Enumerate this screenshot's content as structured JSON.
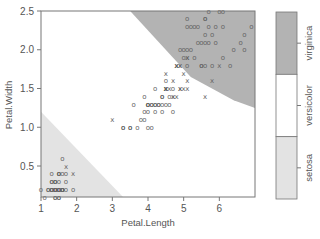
{
  "chart_data": {
    "type": "scatter",
    "title": "",
    "xlabel": "Petal.Length",
    "ylabel": "Petal.Width",
    "xlim": [
      1.0,
      7.0
    ],
    "ylim": [
      0.1,
      2.5
    ],
    "x_ticks": [
      "1",
      "2",
      "3",
      "4",
      "5",
      "6"
    ],
    "y_ticks": [
      "0.5",
      "1.0",
      "1.5",
      "2.0",
      "2.5"
    ],
    "grid": false,
    "legend": {
      "position": "right",
      "type": "colorbar",
      "entries": [
        {
          "label": "virginica",
          "color": "#b3b3b3"
        },
        {
          "label": "versicolor",
          "color": "#ffffff"
        },
        {
          "label": "setosa",
          "color": "#e3e3e3"
        }
      ]
    },
    "regions": [
      {
        "class": "setosa",
        "color": "#e3e3e3",
        "polygon": [
          [
            1.0,
            1.2
          ],
          [
            1.0,
            0.1
          ],
          [
            3.3,
            0.1
          ]
        ]
      },
      {
        "class": "virginica",
        "color": "#b3b3b3",
        "polygon": [
          [
            3.5,
            2.5
          ],
          [
            7.0,
            2.5
          ],
          [
            7.0,
            1.25
          ],
          [
            6.4,
            1.35
          ],
          [
            5.2,
            1.65
          ],
          [
            4.6,
            1.95
          ],
          [
            3.5,
            2.5
          ]
        ]
      }
    ],
    "markers": {
      "support_vector": "x",
      "data_point": "o"
    },
    "series": [
      {
        "name": "setosa",
        "points": [
          [
            1.4,
            0.2
          ],
          [
            1.4,
            0.2
          ],
          [
            1.3,
            0.2
          ],
          [
            1.5,
            0.2
          ],
          [
            1.4,
            0.2
          ],
          [
            1.7,
            0.4
          ],
          [
            1.4,
            0.3
          ],
          [
            1.5,
            0.2
          ],
          [
            1.4,
            0.2
          ],
          [
            1.5,
            0.1
          ],
          [
            1.5,
            0.2
          ],
          [
            1.6,
            0.2
          ],
          [
            1.4,
            0.1
          ],
          [
            1.1,
            0.1
          ],
          [
            1.2,
            0.2
          ],
          [
            1.5,
            0.4
          ],
          [
            1.3,
            0.4
          ],
          [
            1.4,
            0.3
          ],
          [
            1.7,
            0.3
          ],
          [
            1.5,
            0.3
          ],
          [
            1.7,
            0.2
          ],
          [
            1.5,
            0.4
          ],
          [
            1.0,
            0.2
          ],
          [
            1.7,
            0.5
          ],
          [
            1.9,
            0.2
          ],
          [
            1.6,
            0.2
          ],
          [
            1.6,
            0.4
          ],
          [
            1.5,
            0.2
          ],
          [
            1.4,
            0.2
          ],
          [
            1.6,
            0.2
          ],
          [
            1.6,
            0.2
          ],
          [
            1.5,
            0.4
          ],
          [
            1.5,
            0.1
          ],
          [
            1.4,
            0.2
          ],
          [
            1.5,
            0.2
          ],
          [
            1.2,
            0.2
          ],
          [
            1.3,
            0.2
          ],
          [
            1.4,
            0.1
          ],
          [
            1.3,
            0.2
          ],
          [
            1.5,
            0.2
          ],
          [
            1.3,
            0.3
          ],
          [
            1.3,
            0.3
          ],
          [
            1.3,
            0.2
          ],
          [
            1.6,
            0.6
          ],
          [
            1.9,
            0.4
          ],
          [
            1.4,
            0.3
          ],
          [
            1.6,
            0.2
          ],
          [
            1.4,
            0.2
          ],
          [
            1.5,
            0.2
          ],
          [
            1.4,
            0.2
          ]
        ]
      },
      {
        "name": "versicolor",
        "points": [
          [
            4.7,
            1.4
          ],
          [
            4.5,
            1.5
          ],
          [
            4.9,
            1.5
          ],
          [
            4.0,
            1.3
          ],
          [
            4.6,
            1.5
          ],
          [
            4.5,
            1.3
          ],
          [
            4.7,
            1.6
          ],
          [
            3.3,
            1.0
          ],
          [
            4.6,
            1.3
          ],
          [
            3.9,
            1.4
          ],
          [
            3.5,
            1.0
          ],
          [
            4.2,
            1.5
          ],
          [
            4.0,
            1.0
          ],
          [
            4.7,
            1.4
          ],
          [
            3.6,
            1.3
          ],
          [
            4.4,
            1.4
          ],
          [
            4.5,
            1.5
          ],
          [
            4.1,
            1.0
          ],
          [
            4.5,
            1.5
          ],
          [
            3.9,
            1.1
          ],
          [
            4.8,
            1.8
          ],
          [
            4.0,
            1.3
          ],
          [
            4.9,
            1.5
          ],
          [
            4.7,
            1.2
          ],
          [
            4.3,
            1.3
          ],
          [
            4.4,
            1.4
          ],
          [
            4.8,
            1.4
          ],
          [
            5.0,
            1.7
          ],
          [
            4.5,
            1.5
          ],
          [
            3.5,
            1.0
          ],
          [
            3.8,
            1.1
          ],
          [
            3.7,
            1.0
          ],
          [
            3.9,
            1.2
          ],
          [
            5.1,
            1.6
          ],
          [
            4.5,
            1.5
          ],
          [
            4.5,
            1.6
          ],
          [
            4.7,
            1.5
          ],
          [
            4.4,
            1.3
          ],
          [
            4.1,
            1.3
          ],
          [
            4.0,
            1.3
          ],
          [
            4.4,
            1.2
          ],
          [
            4.6,
            1.4
          ],
          [
            4.0,
            1.2
          ],
          [
            3.3,
            1.0
          ],
          [
            4.2,
            1.3
          ],
          [
            4.2,
            1.2
          ],
          [
            4.2,
            1.3
          ],
          [
            4.3,
            1.3
          ],
          [
            3.0,
            1.1
          ],
          [
            4.1,
            1.3
          ]
        ]
      },
      {
        "name": "virginica",
        "points": [
          [
            6.0,
            2.5
          ],
          [
            5.1,
            1.9
          ],
          [
            5.9,
            2.1
          ],
          [
            5.6,
            1.8
          ],
          [
            5.8,
            2.2
          ],
          [
            6.6,
            2.1
          ],
          [
            4.5,
            1.7
          ],
          [
            6.3,
            1.8
          ],
          [
            5.8,
            1.8
          ],
          [
            6.1,
            2.5
          ],
          [
            5.1,
            2.0
          ],
          [
            5.3,
            1.9
          ],
          [
            5.5,
            2.1
          ],
          [
            5.0,
            2.0
          ],
          [
            5.1,
            2.4
          ],
          [
            5.3,
            2.3
          ],
          [
            5.5,
            1.8
          ],
          [
            6.7,
            2.2
          ],
          [
            6.9,
            2.3
          ],
          [
            5.0,
            1.5
          ],
          [
            5.7,
            2.3
          ],
          [
            4.9,
            2.0
          ],
          [
            6.7,
            2.0
          ],
          [
            4.9,
            1.8
          ],
          [
            5.7,
            2.1
          ],
          [
            6.0,
            1.8
          ],
          [
            4.8,
            1.8
          ],
          [
            4.9,
            1.8
          ],
          [
            5.6,
            2.1
          ],
          [
            5.8,
            1.6
          ],
          [
            6.1,
            1.9
          ],
          [
            6.4,
            2.0
          ],
          [
            5.6,
            2.2
          ],
          [
            5.1,
            1.5
          ],
          [
            5.6,
            1.4
          ],
          [
            6.1,
            2.3
          ],
          [
            5.6,
            2.4
          ],
          [
            5.5,
            1.8
          ],
          [
            4.8,
            1.8
          ],
          [
            5.4,
            2.1
          ],
          [
            5.6,
            2.4
          ],
          [
            5.1,
            2.3
          ],
          [
            5.1,
            1.9
          ],
          [
            5.9,
            2.3
          ],
          [
            5.7,
            2.5
          ],
          [
            5.2,
            2.3
          ],
          [
            5.0,
            1.9
          ],
          [
            5.2,
            2.0
          ],
          [
            5.4,
            2.3
          ],
          [
            5.1,
            1.8
          ]
        ]
      }
    ]
  }
}
